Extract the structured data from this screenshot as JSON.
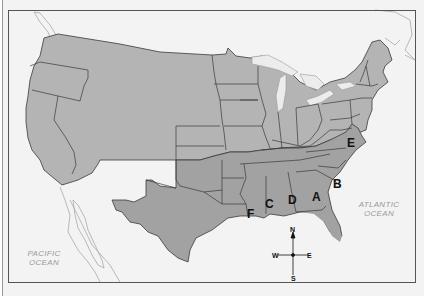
{
  "map": {
    "title": "",
    "colors": {
      "background": "#f3f3f3",
      "union_state_fill": "#b4b4b4",
      "confederate_state_fill": "#a2a2a2",
      "border_line": "#3a3a3a",
      "water_outline": "#9a9a9a",
      "label_text": "#111111",
      "ocean_text": "#9a9a9a"
    },
    "state_labels": [
      {
        "id": "A",
        "text": "A",
        "state": "Georgia"
      },
      {
        "id": "B",
        "text": "B",
        "state": "South Carolina"
      },
      {
        "id": "C",
        "text": "C",
        "state": "Mississippi"
      },
      {
        "id": "D",
        "text": "D",
        "state": "Alabama"
      },
      {
        "id": "E",
        "text": "E",
        "state": "Virginia"
      },
      {
        "id": "F",
        "text": "F",
        "state": "Louisiana"
      }
    ],
    "oceans": [
      {
        "line1": "PACIFIC",
        "line2": "OCEAN"
      },
      {
        "line1": "ATLANTIC",
        "line2": "OCEAN"
      }
    ],
    "compass": {
      "north": "N",
      "south": "S",
      "east": "E",
      "west": "W"
    }
  }
}
